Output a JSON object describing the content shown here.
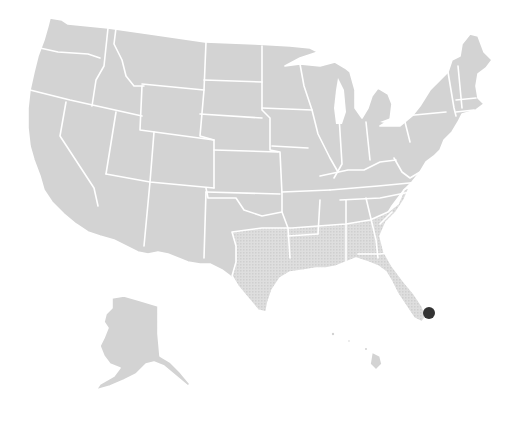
{
  "map": {
    "region": "United States",
    "includes": [
      "Contiguous United States",
      "Alaska",
      "Hawaii"
    ],
    "colors": {
      "land": "#d3d3d3",
      "gulf_states_texture": "#dcdcdc",
      "borders": "#ffffff",
      "background": "#ffffff",
      "marker": "#333333"
    },
    "markers": [
      {
        "name": "location-marker",
        "location": "South Florida",
        "x": 429,
        "y": 313,
        "r": 6
      }
    ]
  }
}
